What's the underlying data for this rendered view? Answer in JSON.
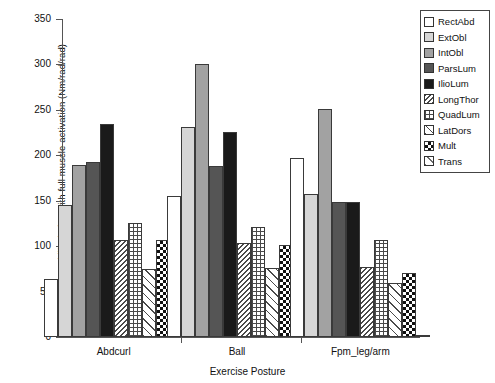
{
  "chart_data": {
    "type": "bar",
    "title": "",
    "xlabel": "Exercise Posture",
    "ylabel": "Increase in stability index with full muscle activation (Nm/rad/rad)",
    "categories": [
      "Abdcurl",
      "Ball",
      "Fpm_leg/arm"
    ],
    "ylim": [
      0,
      350
    ],
    "yticks": [
      0,
      50,
      100,
      150,
      200,
      250,
      300,
      350
    ],
    "grid": false,
    "legend_position": "top-right",
    "series": [
      {
        "name": "RectAbd",
        "fill": "white",
        "values": [
          64,
          155,
          197
        ]
      },
      {
        "name": "ExtObl",
        "fill": "light-gray",
        "values": [
          145,
          231,
          157
        ]
      },
      {
        "name": "IntObl",
        "fill": "medium-gray",
        "values": [
          189,
          300,
          251
        ]
      },
      {
        "name": "ParsLum",
        "fill": "dark-gray",
        "values": [
          193,
          188,
          149
        ]
      },
      {
        "name": "IlioLum",
        "fill": "black",
        "values": [
          234,
          226,
          149
        ]
      },
      {
        "name": "LongThor",
        "fill": "zigzag-hatch",
        "values": [
          107,
          103,
          77
        ]
      },
      {
        "name": "QuadLum",
        "fill": "fine-grid-hatch",
        "values": [
          126,
          121,
          107
        ]
      },
      {
        "name": "LatDors",
        "fill": "diagonal-hatch",
        "values": [
          75,
          76,
          60
        ]
      },
      {
        "name": "Mult",
        "fill": "checkerboard",
        "values": [
          107,
          101,
          71
        ]
      },
      {
        "name": "Trans",
        "fill": "sparse-diagonal",
        "values": [
          0,
          3,
          0
        ]
      }
    ]
  },
  "legend": {
    "items": [
      {
        "label": "RectAbd"
      },
      {
        "label": "ExtObl"
      },
      {
        "label": "IntObl"
      },
      {
        "label": "ParsLum"
      },
      {
        "label": "IlioLum"
      },
      {
        "label": "LongThor"
      },
      {
        "label": "QuadLum"
      },
      {
        "label": "LatDors"
      },
      {
        "label": "Mult"
      },
      {
        "label": "Trans"
      }
    ]
  }
}
